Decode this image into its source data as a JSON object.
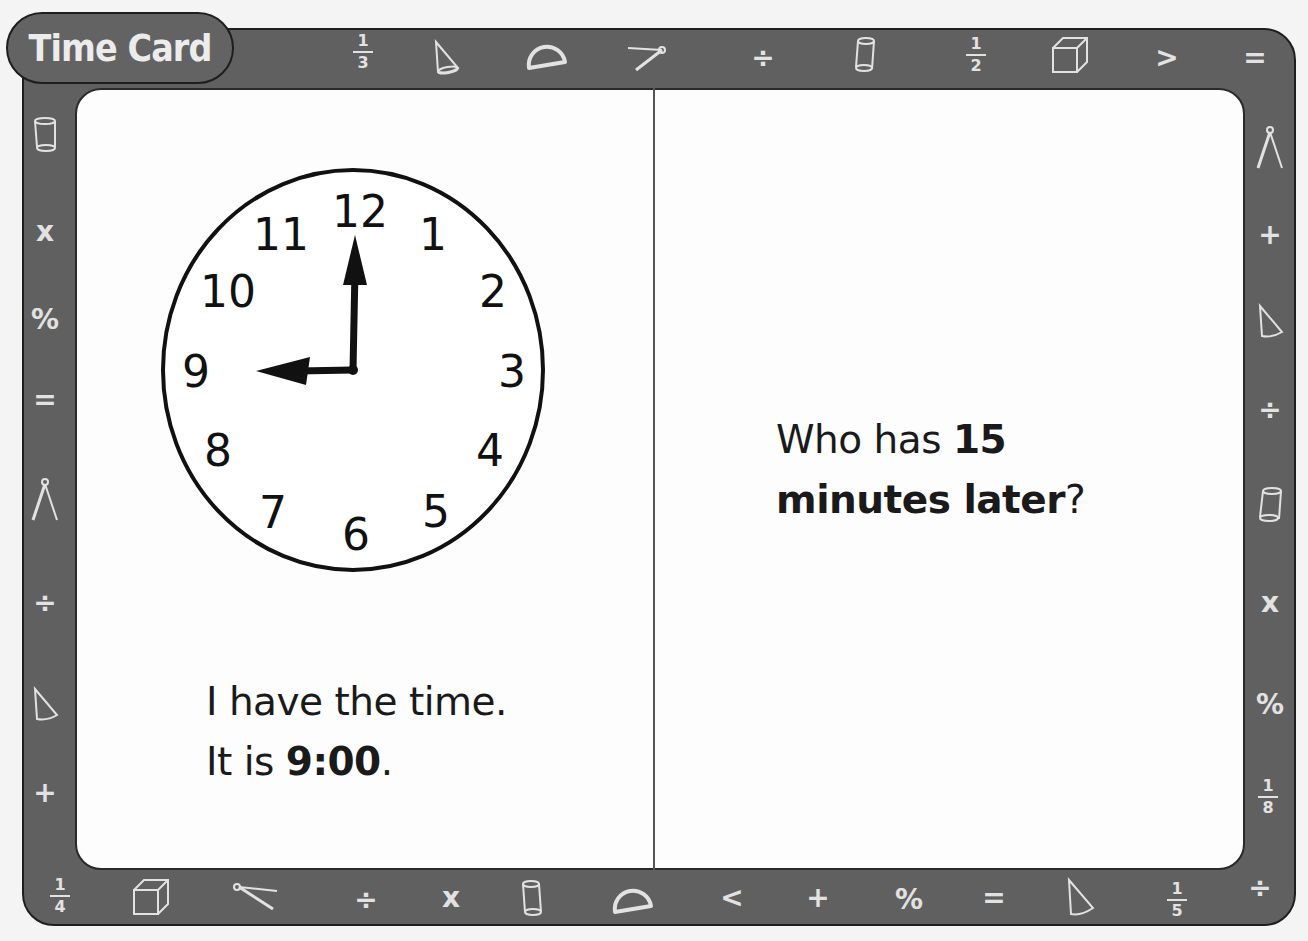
{
  "card": {
    "title": "Time Card",
    "colors": {
      "frame": "#606060",
      "frame_border": "#1e1e1e",
      "symbol": "#e2e2e2",
      "card_bg": "#fdfdfd",
      "ink": "#1a1a1a"
    }
  },
  "left_panel": {
    "clock": {
      "numbers": [
        "12",
        "1",
        "2",
        "3",
        "4",
        "5",
        "6",
        "7",
        "8",
        "9",
        "10",
        "11"
      ],
      "hour_hand_points_to": "9",
      "minute_hand_points_to": "12"
    },
    "line1": "I have the time.",
    "line2_prefix": "It is ",
    "line2_bold": "9:00",
    "line2_suffix": "."
  },
  "right_panel": {
    "line1_prefix": "Who has ",
    "line1_bold": "15",
    "line2_bold": "minutes later",
    "line2_suffix": "?"
  },
  "border_symbols": {
    "top": [
      {
        "type": "fraction",
        "num": "1",
        "den": "3"
      },
      {
        "type": "icon",
        "name": "cone"
      },
      {
        "type": "icon",
        "name": "protractor"
      },
      {
        "type": "icon",
        "name": "compass"
      },
      {
        "type": "text",
        "value": "÷"
      },
      {
        "type": "icon",
        "name": "cylinder"
      },
      {
        "type": "fraction",
        "num": "1",
        "den": "2"
      },
      {
        "type": "icon",
        "name": "cube"
      },
      {
        "type": "text",
        "value": ">"
      },
      {
        "type": "text",
        "value": "="
      }
    ],
    "bottom": [
      {
        "type": "fraction",
        "num": "1",
        "den": "4"
      },
      {
        "type": "icon",
        "name": "cube"
      },
      {
        "type": "icon",
        "name": "compass"
      },
      {
        "type": "text",
        "value": "÷"
      },
      {
        "type": "text",
        "value": "x"
      },
      {
        "type": "icon",
        "name": "cylinder"
      },
      {
        "type": "icon",
        "name": "protractor"
      },
      {
        "type": "text",
        "value": "<"
      },
      {
        "type": "text",
        "value": "+"
      },
      {
        "type": "text",
        "value": "%"
      },
      {
        "type": "text",
        "value": "="
      },
      {
        "type": "icon",
        "name": "cone"
      },
      {
        "type": "fraction",
        "num": "1",
        "den": "5"
      },
      {
        "type": "text",
        "value": "÷"
      }
    ],
    "left": [
      {
        "type": "icon",
        "name": "cylinder"
      },
      {
        "type": "text",
        "value": "x"
      },
      {
        "type": "text",
        "value": "%"
      },
      {
        "type": "text",
        "value": "="
      },
      {
        "type": "icon",
        "name": "compass"
      },
      {
        "type": "text",
        "value": "÷"
      },
      {
        "type": "icon",
        "name": "cone"
      },
      {
        "type": "text",
        "value": "+"
      }
    ],
    "right": [
      {
        "type": "icon",
        "name": "compass"
      },
      {
        "type": "text",
        "value": "+"
      },
      {
        "type": "icon",
        "name": "cone"
      },
      {
        "type": "text",
        "value": "÷"
      },
      {
        "type": "icon",
        "name": "cylinder"
      },
      {
        "type": "text",
        "value": "x"
      },
      {
        "type": "text",
        "value": "%"
      },
      {
        "type": "fraction",
        "num": "1",
        "den": "8"
      }
    ]
  }
}
